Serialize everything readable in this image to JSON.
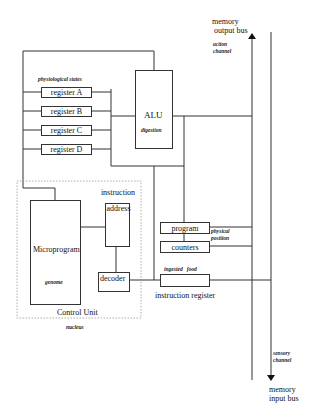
{
  "diagram": {
    "buses": {
      "output": {
        "label_line1": "memory",
        "label_line2": "output bus",
        "note_line1": "action",
        "note_line2": "channel"
      },
      "input": {
        "label_line1": "memory",
        "label_line2": "input bus",
        "note_line1": "sensory",
        "note_line2": "channel"
      }
    },
    "registers": {
      "note": "physiological states",
      "items": [
        {
          "label": "register A"
        },
        {
          "label": "register B"
        },
        {
          "label": "register C"
        },
        {
          "label": "register D"
        }
      ]
    },
    "alu": {
      "label": "ALU",
      "note": "digestion"
    },
    "control_unit": {
      "label": "Control Unit",
      "note": "nucleus"
    },
    "microprogram": {
      "label": "Microprogram",
      "note": "genome"
    },
    "instruction_address": {
      "label_line1": "instruction",
      "label_line2": "address"
    },
    "decoder": {
      "label": "decoder"
    },
    "program_counters": {
      "label_top": "program",
      "label_bottom": "counters",
      "note_line1": "physical",
      "note_line2": "position"
    },
    "instruction_register": {
      "label": "instruction register",
      "note": "ingested   food"
    }
  }
}
